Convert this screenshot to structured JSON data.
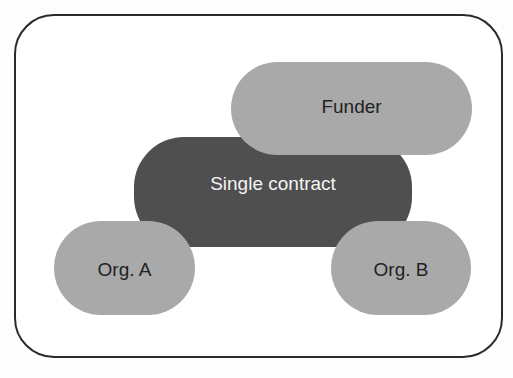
{
  "diagram": {
    "type": "overlapping-entity-diagram",
    "frame": {
      "shape": "rounded-rectangle",
      "border_color": "#2a2a2a"
    },
    "nodes": [
      {
        "id": "funder",
        "label": "Funder",
        "fill": "#a9a9a9",
        "text_color": "#222222"
      },
      {
        "id": "contract",
        "label": "Single contract",
        "fill": "#4f4f4f",
        "text_color": "#f4f4f4"
      },
      {
        "id": "orga",
        "label": "Org. A",
        "fill": "#a9a9a9",
        "text_color": "#222222"
      },
      {
        "id": "orgb",
        "label": "Org. B",
        "fill": "#a9a9a9",
        "text_color": "#222222"
      }
    ],
    "relations": [
      {
        "from": "funder",
        "to": "contract",
        "type": "overlap"
      },
      {
        "from": "orga",
        "to": "contract",
        "type": "overlap"
      },
      {
        "from": "orgb",
        "to": "contract",
        "type": "overlap"
      }
    ]
  }
}
